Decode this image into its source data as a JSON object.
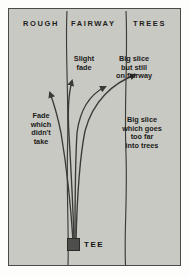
{
  "diagram": {
    "background_color": "#c9c9c4",
    "border_color": "#4a4a48",
    "line_color": "#3a3a38",
    "zones": [
      {
        "id": "rough",
        "label": "ROUGH"
      },
      {
        "id": "fairway",
        "label": "FAIRWAY"
      },
      {
        "id": "trees",
        "label": "TREES"
      }
    ],
    "annotations": [
      {
        "id": "slight-fade",
        "text": "Slight\nfade"
      },
      {
        "id": "big-slice-fairway",
        "text": "Big slice\nbut still\non fairway"
      },
      {
        "id": "fade-didnt-take",
        "text": "Fade\nwhich\ndidn't\ntake"
      },
      {
        "id": "big-slice-trees",
        "text": "Big slice\nwhich goes\ntoo far\ninto trees"
      }
    ],
    "notes": {
      "slight_fade_line1": "Slight",
      "slight_fade_line2": "fade",
      "big_slice_fairway_line1": "Big slice",
      "big_slice_fairway_line2": "but still",
      "big_slice_fairway_line3": "on fairway",
      "fade_didnt_take_line1": "Fade",
      "fade_didnt_take_line2": "which",
      "fade_didnt_take_line3": "didn't",
      "fade_didnt_take_line4": "take",
      "big_slice_trees_line1": "Big slice",
      "big_slice_trees_line2": "which goes",
      "big_slice_trees_line3": "too far",
      "big_slice_trees_line4": "into trees"
    },
    "tee": {
      "label": "TEE",
      "marker_color": "#4e4e4c"
    },
    "trajectories": [
      {
        "id": "fade-didnt-take",
        "description": "Fade which didn't take — pulls left into rough"
      },
      {
        "id": "slight-fade",
        "description": "Slight fade — small curve right, stays left fairway"
      },
      {
        "id": "big-slice-fairway",
        "description": "Big slice but still on fairway"
      },
      {
        "id": "big-slice-trees",
        "description": "Big slice which goes too far into trees"
      }
    ]
  }
}
